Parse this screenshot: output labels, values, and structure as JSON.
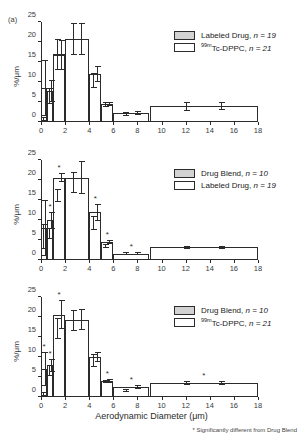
{
  "figure": {
    "panel_label": "(a)",
    "xaxis_title": "Aerodynamic Diameter (μm)",
    "yaxis_title": "%/μm",
    "footnote": "* Significantly different from Drug Blend",
    "colors": {
      "axis": "#2b2b2b",
      "hatch_fill": "#d2d2d2",
      "open_fill": "#ffffff"
    }
  },
  "axes": {
    "x_ticks": [
      "0",
      "2",
      "4",
      "6",
      "8",
      "10",
      "12",
      "14",
      "16",
      "18"
    ],
    "x_tick_values": [
      0,
      2,
      4,
      6,
      8,
      10,
      12,
      14,
      16,
      18
    ],
    "y_ticks": [
      "0",
      "5",
      "10",
      "15",
      "20",
      "25"
    ],
    "y_tick_values": [
      0,
      5,
      10,
      15,
      20,
      25
    ],
    "xlim": [
      0,
      18
    ],
    "ylim": [
      0,
      25
    ],
    "grid": false
  },
  "chart_data": [
    {
      "type": "bar",
      "panel": "(a)",
      "title": "",
      "xlabel": "Aerodynamic Diameter (μm)",
      "ylabel": "%/μm",
      "xlim": [
        0,
        18
      ],
      "ylim": [
        0,
        25
      ],
      "grid": false,
      "legend_position": "top-right",
      "bin_edges": [
        0,
        0.5,
        1.0,
        2.0,
        4.0,
        5.0,
        6.0,
        9.0,
        18.0
      ],
      "bin_centers": [
        0.25,
        0.75,
        1.5,
        3.0,
        4.5,
        5.5,
        7.5,
        13.5
      ],
      "series": [
        {
          "name": "Labeled Drug",
          "n": 19,
          "style": "hatch",
          "values": [
            0.8,
            6.6,
            16.9,
            20.8,
            10.3,
            4.3,
            2.1,
            3.8
          ],
          "errors": [
            0.5,
            2.0,
            3.8,
            4.0,
            1.9,
            0.6,
            0.5,
            1.1
          ]
        },
        {
          "name": "99mTc-DPPC",
          "n": 21,
          "style": "open",
          "values": [
            8.4,
            7.8,
            16.8,
            20.8,
            12.0,
            4.4,
            2.2,
            3.9
          ],
          "errors": [
            7.0,
            2.8,
            3.8,
            4.0,
            2.0,
            0.5,
            0.5,
            1.0
          ]
        }
      ],
      "significance_markers": []
    },
    {
      "type": "bar",
      "panel": "",
      "title": "",
      "xlabel": "Aerodynamic Diameter (μm)",
      "ylabel": "%/μm",
      "xlim": [
        0,
        18
      ],
      "ylim": [
        0,
        25
      ],
      "grid": false,
      "legend_position": "top-right",
      "bin_edges": [
        0,
        0.5,
        1.0,
        2.0,
        4.0,
        5.0,
        6.0,
        9.0,
        18.0
      ],
      "bin_centers": [
        0.25,
        0.75,
        1.5,
        3.0,
        4.5,
        5.5,
        7.5,
        13.5
      ],
      "series": [
        {
          "name": "Drug Blend",
          "n": 10,
          "style": "hatch",
          "values": [
            5.9,
            6.6,
            16.2,
            19.4,
            9.2,
            3.5,
            1.6,
            3.2
          ],
          "errors": [
            3.2,
            1.4,
            1.6,
            2.6,
            1.7,
            0.5,
            0.3,
            0.4
          ]
        },
        {
          "name": "Labeled Drug",
          "n": 19,
          "style": "open",
          "values": [
            8.1,
            9.9,
            20.6,
            20.6,
            11.9,
            4.5,
            1.6,
            3.2
          ],
          "errors": [
            7.0,
            2.2,
            1.2,
            4.2,
            2.2,
            0.5,
            0.3,
            0.4
          ]
        }
      ],
      "significance_markers": [
        0.75,
        1.5,
        4.5,
        5.5,
        7.5
      ]
    },
    {
      "type": "bar",
      "panel": "",
      "title": "",
      "xlabel": "Aerodynamic Diameter (μm)",
      "ylabel": "%/μm",
      "xlim": [
        0,
        18
      ],
      "ylim": [
        0,
        25
      ],
      "grid": false,
      "legend_position": "top-right",
      "bin_edges": [
        0,
        0.5,
        1.0,
        2.0,
        4.0,
        5.0,
        6.0,
        9.0,
        18.0
      ],
      "bin_centers": [
        0.25,
        0.75,
        1.5,
        3.0,
        4.5,
        5.5,
        7.5,
        13.5
      ],
      "series": [
        {
          "name": "Drug Blend",
          "n": 10,
          "style": "hatch",
          "values": [
            0.8,
            6.7,
            17.2,
            19.2,
            9.2,
            3.9,
            1.6,
            3.6
          ],
          "errors": [
            0.5,
            1.4,
            2.6,
            2.6,
            1.6,
            0.4,
            0.3,
            0.5
          ]
        },
        {
          "name": "99mTc-DPPC",
          "n": 21,
          "style": "open",
          "values": [
            7.0,
            7.9,
            20.6,
            19.3,
            10.0,
            4.0,
            2.4,
            3.6
          ],
          "errors": [
            4.2,
            1.6,
            3.6,
            2.6,
            1.2,
            0.4,
            0.5,
            0.5
          ]
        }
      ],
      "significance_markers": [
        0.25,
        0.75,
        1.5,
        5.5,
        7.5,
        13.5
      ]
    }
  ],
  "legends": [
    {
      "rows": [
        {
          "label": "Labeled Drug",
          "n_text": "n = 19",
          "style": "hatch",
          "prefix": ""
        },
        {
          "label": "Tc-DPPC",
          "n_text": "n = 21",
          "style": "open",
          "prefix": "99m"
        }
      ]
    },
    {
      "rows": [
        {
          "label": "Drug Blend",
          "n_text": "n = 10",
          "style": "hatch",
          "prefix": ""
        },
        {
          "label": "Labeled Drug",
          "n_text": "n = 19",
          "style": "open",
          "prefix": ""
        }
      ]
    },
    {
      "rows": [
        {
          "label": "Drug Blend",
          "n_text": "n = 10",
          "style": "hatch",
          "prefix": ""
        },
        {
          "label": "Tc-DPPC",
          "n_text": "n = 21",
          "style": "open",
          "prefix": "99m"
        }
      ]
    }
  ]
}
